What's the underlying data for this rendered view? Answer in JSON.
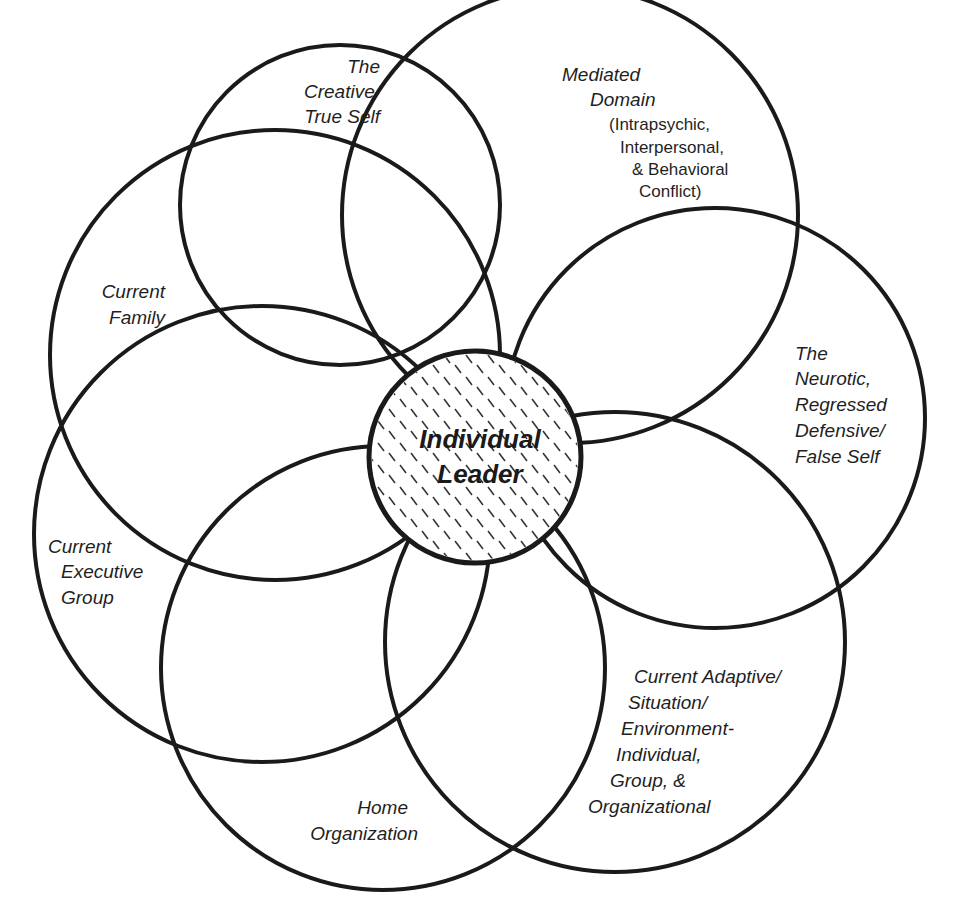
{
  "diagram": {
    "center": {
      "line1": "Individual",
      "line2": "Leader"
    },
    "domains": [
      {
        "id": "creative-true-self",
        "lines": [
          "The",
          "Creative/",
          "True Self"
        ]
      },
      {
        "id": "mediated-domain",
        "lines": [
          "Mediated",
          "Domain"
        ],
        "sub_lines": [
          "(Intrapsychic,",
          "Interpersonal,",
          "& Behavioral",
          "Conflict)"
        ]
      },
      {
        "id": "neurotic-false-self",
        "lines": [
          "The",
          "Neurotic,",
          "Regressed",
          "Defensive/",
          "False Self"
        ]
      },
      {
        "id": "current-adaptive",
        "lines": [
          "Current Adaptive/",
          "Situation/",
          "Environment-",
          "Individual,",
          "Group, &",
          "Organizational"
        ]
      },
      {
        "id": "home-organization",
        "lines": [
          "Home",
          "Organization"
        ]
      },
      {
        "id": "current-executive-group",
        "lines": [
          "Current",
          "Executive",
          "Group"
        ]
      },
      {
        "id": "current-family",
        "lines": [
          "Current",
          "Family"
        ]
      }
    ]
  }
}
